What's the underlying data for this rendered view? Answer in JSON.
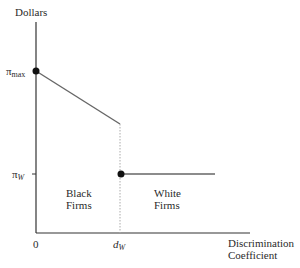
{
  "diagram": {
    "y_axis_label": "Dollars",
    "x_axis_label_line1": "Discrimination",
    "x_axis_label_line2": "Coefficient",
    "y_ticks": {
      "pi_max": {
        "symbol": "π",
        "sub": "max"
      },
      "pi_w": {
        "symbol": "π",
        "sub": "W"
      }
    },
    "x_ticks": {
      "origin": "0",
      "d_w": {
        "symbol": "d",
        "sub": "W"
      }
    },
    "regions": {
      "black_line1": "Black",
      "black_line2": "Firms",
      "white_line1": "White",
      "white_line2": "Firms"
    },
    "colors": {
      "axis": "#333333",
      "curve": "#666666",
      "dotted": "#aaaaaa",
      "point": "#111111"
    }
  }
}
